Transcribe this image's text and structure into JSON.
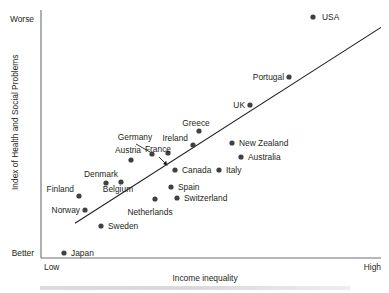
{
  "chart_data": {
    "type": "scatter",
    "title": "",
    "xlabel": "Income inequality",
    "ylabel": "Index of Health and Social Problems",
    "x_tick_labels": [
      "Low",
      "High"
    ],
    "y_tick_labels": [
      "Better",
      "Worse"
    ],
    "grid": false,
    "legend": "none",
    "xlim": [
      0,
      100
    ],
    "ylim": [
      0,
      100
    ],
    "axis_anchors": {
      "y_top": "Worse",
      "y_bottom": "Better",
      "x_left": "Low",
      "x_right": "High"
    },
    "trendline": {
      "present": true,
      "x": [
        10,
        100
      ],
      "y": [
        14,
        93
      ]
    },
    "points": [
      {
        "label": "USA",
        "px": 313,
        "py": 17,
        "lx": 322,
        "ly": 20,
        "anchor": "start"
      },
      {
        "label": "Portugal",
        "px": 289,
        "py": 77,
        "lx": 284,
        "ly": 80,
        "anchor": "end"
      },
      {
        "label": "UK",
        "px": 250,
        "py": 105,
        "lx": 245,
        "ly": 108,
        "anchor": "end"
      },
      {
        "label": "Greece",
        "px": 199,
        "py": 131,
        "lx": 196,
        "ly": 126,
        "anchor": "middle"
      },
      {
        "label": "New Zealand",
        "px": 232,
        "py": 143,
        "lx": 239,
        "ly": 146,
        "anchor": "start"
      },
      {
        "label": "Ireland",
        "px": 193,
        "py": 145,
        "lx": 188,
        "ly": 141,
        "anchor": "end"
      },
      {
        "label": "Germany",
        "px": 152,
        "py": 154,
        "lx": 135,
        "ly": 140,
        "anchor": "middle"
      },
      {
        "label": "Austria",
        "px": 131,
        "py": 160,
        "lx": 128,
        "ly": 153,
        "anchor": "middle"
      },
      {
        "label": "France",
        "px": 168,
        "py": 153,
        "lx": 158,
        "ly": 152,
        "anchor": "middle"
      },
      {
        "label": "Australia",
        "px": 241,
        "py": 157,
        "lx": 248,
        "ly": 160,
        "anchor": "start"
      },
      {
        "label": "Canada",
        "px": 175,
        "py": 170,
        "lx": 182,
        "ly": 173,
        "anchor": "start"
      },
      {
        "label": "Italy",
        "px": 219,
        "py": 170,
        "lx": 226,
        "ly": 173,
        "anchor": "start"
      },
      {
        "label": "Denmark",
        "px": 106,
        "py": 183,
        "lx": 101,
        "ly": 177,
        "anchor": "middle"
      },
      {
        "label": "Belgium",
        "px": 121,
        "py": 182,
        "lx": 118,
        "ly": 192,
        "anchor": "middle"
      },
      {
        "label": "Spain",
        "px": 171,
        "py": 187,
        "lx": 178,
        "ly": 190,
        "anchor": "start"
      },
      {
        "label": "Finland",
        "px": 79,
        "py": 196,
        "lx": 74,
        "ly": 192,
        "anchor": "end"
      },
      {
        "label": "Switzerland",
        "px": 177,
        "py": 198,
        "lx": 184,
        "ly": 201,
        "anchor": "start"
      },
      {
        "label": "Netherlands",
        "px": 155,
        "py": 199,
        "lx": 150,
        "ly": 215,
        "anchor": "middle"
      },
      {
        "label": "Norway",
        "px": 85,
        "py": 210,
        "lx": 80,
        "ly": 213,
        "anchor": "end"
      },
      {
        "label": "Sweden",
        "px": 101,
        "py": 226,
        "lx": 108,
        "ly": 229,
        "anchor": "start"
      },
      {
        "label": "Japan",
        "px": 64,
        "py": 253,
        "lx": 71,
        "ly": 256,
        "anchor": "start"
      }
    ],
    "leaders": [
      {
        "label": "Germany",
        "x1": 136,
        "y1": 144,
        "x2": 150,
        "y2": 152,
        "arrow": false
      },
      {
        "label": "France",
        "x1": 159,
        "y1": 157,
        "x2": 167,
        "y2": 165,
        "arrow": true
      }
    ]
  }
}
